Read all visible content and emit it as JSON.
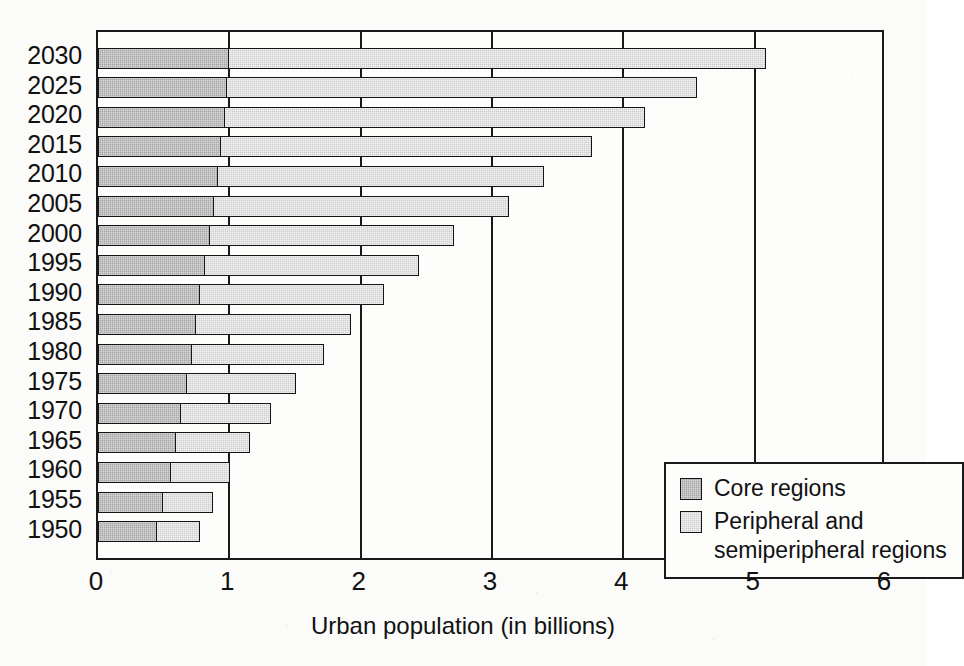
{
  "chart_data": {
    "type": "bar",
    "orientation": "horizontal",
    "stacked": true,
    "title": "",
    "xlabel": "Urban population (in billions)",
    "ylabel": "",
    "xlim": [
      0,
      6
    ],
    "xticks": [
      "0",
      "1",
      "2",
      "3",
      "4",
      "5",
      "6"
    ],
    "grid": "vertical",
    "legend_position": "inner-bottom-right",
    "categories": [
      "2030",
      "2025",
      "2020",
      "2015",
      "2010",
      "2005",
      "2000",
      "1995",
      "1990",
      "1985",
      "1980",
      "1975",
      "1970",
      "1965",
      "1960",
      "1955",
      "1950"
    ],
    "series": [
      {
        "name": "Core regions",
        "color": "#a6a6a6",
        "values": [
          1.0,
          0.99,
          0.97,
          0.94,
          0.92,
          0.89,
          0.86,
          0.82,
          0.78,
          0.75,
          0.72,
          0.68,
          0.64,
          0.6,
          0.56,
          0.5,
          0.45
        ]
      },
      {
        "name": "Peripheral and semiperipheral regions",
        "color": "#cfcfcf",
        "values": [
          4.1,
          3.58,
          3.21,
          2.83,
          2.49,
          2.25,
          1.86,
          1.64,
          1.41,
          1.19,
          1.01,
          0.84,
          0.69,
          0.57,
          0.46,
          0.39,
          0.34
        ]
      }
    ],
    "totals": [
      5.1,
      4.57,
      4.18,
      3.77,
      3.41,
      3.14,
      2.72,
      2.46,
      2.19,
      1.94,
      1.73,
      1.52,
      1.33,
      1.17,
      1.02,
      0.89,
      0.79
    ]
  },
  "legend": {
    "items": [
      {
        "label": "Core regions",
        "swatch": "core-swatch"
      },
      {
        "label": "Peripheral and\nsemiperipheral regions",
        "swatch": "peripheral-swatch"
      }
    ]
  },
  "axis": {
    "x_label": "Urban population (in billions)"
  },
  "colors": {
    "core": "#a6a6a6",
    "peripheral": "#cfcfcf",
    "axis": "#1a1a1a",
    "background": "#fbfbfa"
  }
}
